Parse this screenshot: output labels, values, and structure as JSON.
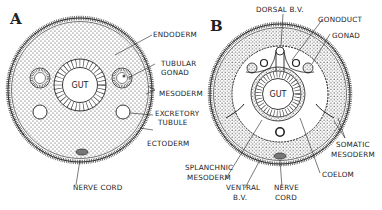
{
  "figure": {
    "panel_a": {
      "letter": "A",
      "gut_label": "GUT",
      "labels": {
        "endoderm": "ENDODERM",
        "tubular_1": "TUBULAR",
        "tubular_2": "GONAD",
        "mesoderm": "MESODERM",
        "excretory_1": "EXCRETORY",
        "excretory_2": "TUBULE",
        "ectoderm": "ECTODERM",
        "nerve_cord": "NERVE CORD"
      }
    },
    "panel_b": {
      "letter": "B",
      "gut_label": "GUT",
      "labels": {
        "dorsal_bv": "DORSAL B.V.",
        "gonoduct": "GONODUCT",
        "gonad": "GONAD",
        "somatic_1": "SOMATIC",
        "somatic_2": "MESODERM",
        "coelom": "COELOM",
        "splanchnic_1": "SPLANCHNIC",
        "splanchnic_2": "MESODERM",
        "ventral_1": "VENTRAL",
        "ventral_2": "B.V.",
        "nerve_1": "NERVE",
        "nerve_2": "CORD"
      }
    },
    "colors": {
      "ink": "#222222",
      "paper": "#ffffff",
      "stipple": "#3a3a3a"
    }
  }
}
